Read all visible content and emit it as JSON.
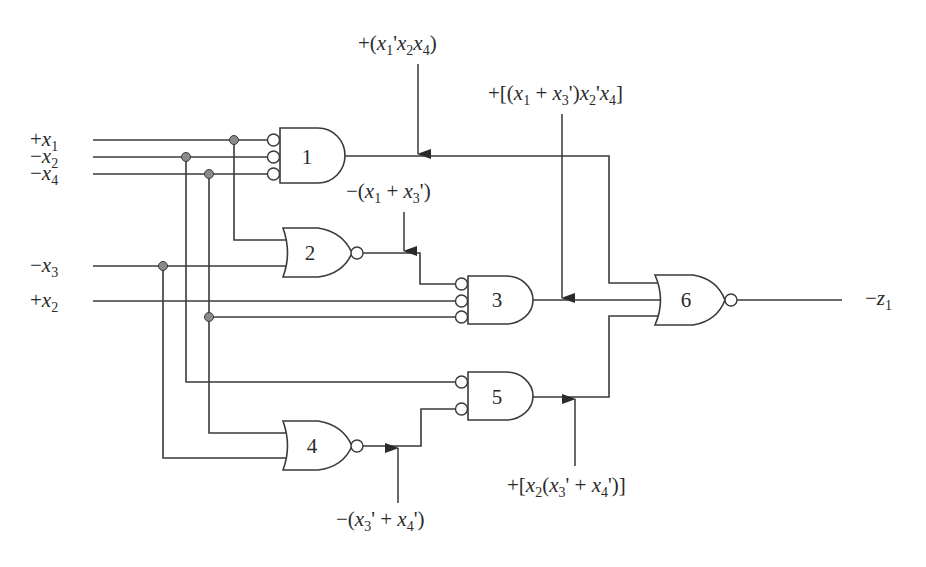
{
  "diagram": {
    "type": "logic-circuit",
    "inputs": [
      {
        "id": "x1",
        "sign": "+",
        "var": "x",
        "sub": "1"
      },
      {
        "id": "x2n",
        "sign": "−",
        "var": "x",
        "sub": "2"
      },
      {
        "id": "x4",
        "sign": "−",
        "var": "x",
        "sub": "4"
      },
      {
        "id": "x3",
        "sign": "−",
        "var": "x",
        "sub": "3"
      },
      {
        "id": "x2p",
        "sign": "+",
        "var": "x",
        "sub": "2"
      }
    ],
    "output": {
      "sign": "−",
      "var": "z",
      "sub": "1"
    },
    "gates": [
      {
        "id": "1",
        "label": "1",
        "type": "AND",
        "inverted_inputs": 3
      },
      {
        "id": "2",
        "label": "2",
        "type": "NOR"
      },
      {
        "id": "3",
        "label": "3",
        "type": "AND",
        "inverted_inputs": 3
      },
      {
        "id": "4",
        "label": "4",
        "type": "NOR"
      },
      {
        "id": "5",
        "label": "5",
        "type": "AND",
        "inverted_inputs": 2
      },
      {
        "id": "6",
        "label": "6",
        "type": "NOR"
      }
    ],
    "annotations": {
      "g1_out": "+(x1'x2x4)",
      "g2_out": "−(x1 + x3')",
      "g3_out": "+[(x1 + x3')x2'x4]",
      "g4_out": "−(x3' + x4')",
      "g5_out": "+[x2(x3' + x4')]"
    }
  }
}
